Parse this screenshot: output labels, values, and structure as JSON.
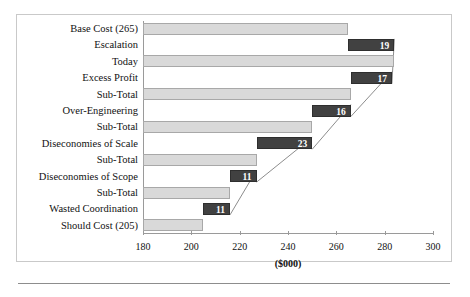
{
  "figure": {
    "axis_title": "($000)",
    "colors": {
      "total_bar": "#d9d9d9",
      "delta_bar": "#414141",
      "axis": "#9a9a9a",
      "value_text": "#ffffff"
    }
  },
  "chart_data": {
    "type": "bar",
    "chart_style": "waterfall",
    "orientation": "horizontal",
    "title": "",
    "xlabel": "($000)",
    "ylabel": "",
    "xlim": [
      180,
      300
    ],
    "xticks": [
      180,
      200,
      220,
      240,
      260,
      280,
      300
    ],
    "xtick_labels": [
      "180",
      "200",
      "220",
      "240",
      "260",
      "280",
      "300"
    ],
    "grid": false,
    "legend": "none",
    "categories": [
      "Base Cost (265)",
      "Escalation",
      "Today",
      "Excess Profit",
      "Sub-Total",
      "Over-Engineering",
      "Sub-Total",
      "Diseconomies of Scale",
      "Sub-Total",
      "Diseconomies of Scope",
      "Sub-Total",
      "Wasted Coordination",
      "Should Cost (205)"
    ],
    "bars": [
      {
        "label": "Base Cost (265)",
        "kind": "total",
        "start": 180,
        "end": 265,
        "value_label": ""
      },
      {
        "label": "Escalation",
        "kind": "delta",
        "start": 265,
        "end": 284,
        "value_label": "19"
      },
      {
        "label": "Today",
        "kind": "total",
        "start": 180,
        "end": 284,
        "value_label": ""
      },
      {
        "label": "Excess Profit",
        "kind": "delta",
        "start": 266,
        "end": 283,
        "value_label": "17"
      },
      {
        "label": "Sub-Total",
        "kind": "total",
        "start": 180,
        "end": 266,
        "value_label": ""
      },
      {
        "label": "Over-Engineering",
        "kind": "delta",
        "start": 250,
        "end": 266,
        "value_label": "16"
      },
      {
        "label": "Sub-Total",
        "kind": "total",
        "start": 180,
        "end": 250,
        "value_label": ""
      },
      {
        "label": "Diseconomies of Scale",
        "kind": "delta",
        "start": 227,
        "end": 250,
        "value_label": "23"
      },
      {
        "label": "Sub-Total",
        "kind": "total",
        "start": 180,
        "end": 227,
        "value_label": ""
      },
      {
        "label": "Diseconomies of Scope",
        "kind": "delta",
        "start": 216,
        "end": 227,
        "value_label": "11"
      },
      {
        "label": "Sub-Total",
        "kind": "total",
        "start": 180,
        "end": 216,
        "value_label": ""
      },
      {
        "label": "Wasted Coordination",
        "kind": "delta",
        "start": 205,
        "end": 216,
        "value_label": "11"
      },
      {
        "label": "Should Cost (205)",
        "kind": "total",
        "start": 180,
        "end": 205,
        "value_label": ""
      }
    ],
    "connectors": [
      {
        "from_row": 1,
        "to_row": 3
      },
      {
        "from_row": 3,
        "to_row": 5
      },
      {
        "from_row": 5,
        "to_row": 7
      },
      {
        "from_row": 7,
        "to_row": 9
      },
      {
        "from_row": 9,
        "to_row": 11
      }
    ]
  }
}
